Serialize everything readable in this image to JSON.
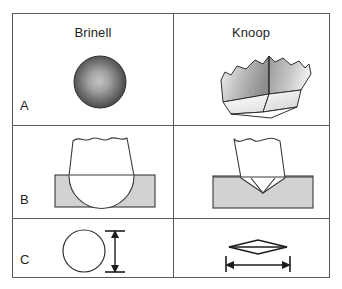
{
  "figure": {
    "columns": [
      {
        "key": "brinell",
        "label": "Brinell"
      },
      {
        "key": "knoop",
        "label": "Knoop"
      }
    ],
    "rows": [
      {
        "key": "a",
        "label": "A",
        "description": "Indenter shape (3D view)"
      },
      {
        "key": "b",
        "label": "B",
        "description": "Side view of indentation"
      },
      {
        "key": "c",
        "label": "C",
        "description": "Top view of indentation with measured dimension"
      }
    ],
    "cells": {
      "a_brinell": {
        "shape": "sphere",
        "caption": ""
      },
      "a_knoop": {
        "shape": "elongated-pyramid",
        "caption": ""
      },
      "b_brinell": {
        "shape": "spherical-indenter-in-specimen",
        "caption": ""
      },
      "b_knoop": {
        "shape": "pointed-pyramid-indenter-in-specimen",
        "caption": ""
      },
      "c_brinell": {
        "shape": "circle-with-vertical-dimension",
        "caption": ""
      },
      "c_knoop": {
        "shape": "rhombus-with-horizontal-dimension",
        "caption": ""
      }
    },
    "colors": {
      "border": "#5a5a5a",
      "outline": "#3a3a3a",
      "specimen_fill": "#d2d2d2",
      "sphere_dark": "#4b4b4b",
      "sphere_light": "#b9b9b9",
      "indenter_fill": "#ffffff",
      "text": "#1d1d1d",
      "background": "#ffffff"
    }
  }
}
